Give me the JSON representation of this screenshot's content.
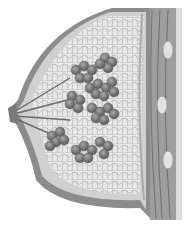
{
  "image": {
    "subject": "breast anatomy cross-section illustration",
    "style": "grayscale",
    "colors": {
      "background": "#ffffff",
      "skin": "#8a8a8a",
      "fat": "#e6e6e6",
      "fat_lines": "#b4b4b4",
      "lobules": "#7a7a7a",
      "muscle": "#9a9a9a",
      "rib": "#d8d8d8"
    }
  }
}
